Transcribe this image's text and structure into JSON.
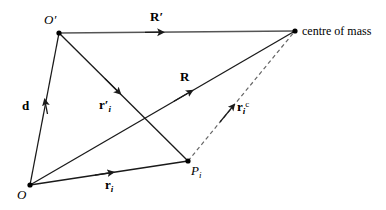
{
  "figure": {
    "background_color": "#ffffff",
    "line_color": "#1a1a1a",
    "accent_line_color": "#555555",
    "dashed_line_color": "#555555",
    "width": 386,
    "height": 210
  },
  "points": [
    {
      "id": "O",
      "label": "O",
      "x": 30,
      "y": 185,
      "label_x": 17,
      "label_y": 188
    },
    {
      "id": "Op",
      "label": "O",
      "prime": "′",
      "x": 59,
      "y": 33,
      "label_x": 46,
      "label_y": 14
    },
    {
      "id": "Pi",
      "label": "P",
      "sub": "i",
      "x": 188,
      "y": 161,
      "label_x": 191,
      "label_y": 164
    },
    {
      "id": "C",
      "label": "centre of mass",
      "x": 295,
      "y": 31,
      "label_x": 302,
      "label_y": 25
    }
  ],
  "vectors": [
    {
      "id": "R-prime",
      "label": "R",
      "prime": "′",
      "from": "Op",
      "to": "C",
      "style": "solid",
      "color": "#555555",
      "label_x": 150,
      "label_y": 11,
      "arrow_t": 0.43
    },
    {
      "id": "d",
      "label": "d",
      "from": "O",
      "to": "Op",
      "style": "solid",
      "color": "#1a1a1a",
      "label_x": 22,
      "label_y": 100,
      "arrow_t": 0.52
    },
    {
      "id": "r-prime-i",
      "label": "r",
      "prime": "′",
      "sub": "i",
      "from": "Op",
      "to": "Pi",
      "style": "solid",
      "color": "#1a1a1a",
      "label_x": 99,
      "label_y": 99,
      "arrow_t": 0.47
    },
    {
      "id": "R",
      "label": "R",
      "from": "O",
      "to": "C",
      "style": "solid",
      "color": "#1a1a1a",
      "label_x": 180,
      "label_y": 70,
      "arrow_t": 0.6
    },
    {
      "id": "r-i",
      "label": "r",
      "sub": "i",
      "from": "O",
      "to": "Pi",
      "style": "solid",
      "color": "#1a1a1a",
      "label_x": 105,
      "label_y": 179,
      "arrow_t": 0.5
    },
    {
      "id": "r-i-c",
      "label": "r",
      "sub": "i",
      "sup": "c",
      "from": "Pi",
      "to": "C",
      "style": "dashed",
      "color": "#555555",
      "label_x": 237,
      "label_y": 101,
      "arrow_t": 0.45
    }
  ],
  "labels": {
    "centre_of_mass": "centre of mass",
    "O": "O",
    "O_prime": "O′",
    "P_i": "Pi",
    "R": "R",
    "R_prime": "R′",
    "d": "d",
    "r_i": "ri",
    "r_prime_i": "r′i",
    "r_i_c": "ric"
  }
}
